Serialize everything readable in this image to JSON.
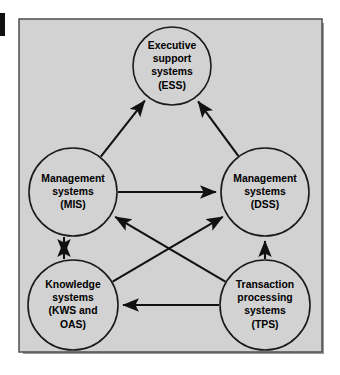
{
  "figure": {
    "background_color": "#d2d2d2",
    "border_color": "#4e4e4e",
    "line_color": "#111111",
    "text_color": "#000000"
  },
  "nodes": [
    {
      "id": "ess",
      "name": "executive-support-systems",
      "lines": [
        "Executive",
        "support",
        "systems",
        "(ESS)"
      ],
      "cx": 172,
      "cy": 66,
      "r": 39
    },
    {
      "id": "mis",
      "name": "management-information-systems",
      "lines": [
        "Management",
        "systems",
        "(MIS)"
      ],
      "cx": 73,
      "cy": 192,
      "r": 44
    },
    {
      "id": "dss",
      "name": "decision-support-systems",
      "lines": [
        "Management",
        "systems",
        "(DSS)"
      ],
      "cx": 265,
      "cy": 192,
      "r": 44
    },
    {
      "id": "kws",
      "name": "knowledge-work-and-office-automation-systems",
      "lines": [
        "Knowledge",
        "systems",
        "(KWS and",
        "OAS)"
      ],
      "cx": 73,
      "cy": 305,
      "r": 45
    },
    {
      "id": "tps",
      "name": "transaction-processing-systems",
      "lines": [
        "Transaction",
        "processing",
        "systems",
        "(TPS)"
      ],
      "cx": 265,
      "cy": 305,
      "r": 45
    }
  ],
  "edges": [
    {
      "name": "edge-mis-to-ess",
      "from": "mis",
      "to": "ess",
      "label": "MIS to ESS"
    },
    {
      "name": "edge-dss-to-ess",
      "from": "dss",
      "to": "ess",
      "label": "DSS to ESS"
    },
    {
      "name": "edge-mis-to-dss",
      "from": "mis",
      "to": "dss",
      "label": "MIS to DSS"
    },
    {
      "name": "edge-mis-to-kws",
      "from": "mis",
      "to": "kws",
      "label": "MIS to KWS"
    },
    {
      "name": "edge-kws-to-mis",
      "from": "kws",
      "to": "mis",
      "label": "KWS to MIS"
    },
    {
      "name": "edge-tps-to-dss",
      "from": "tps",
      "to": "dss",
      "label": "TPS to DSS"
    },
    {
      "name": "edge-tps-to-mis",
      "from": "tps",
      "to": "mis",
      "label": "TPS to MIS"
    },
    {
      "name": "edge-kws-to-dss",
      "from": "kws",
      "to": "dss",
      "label": "KWS to DSS"
    },
    {
      "name": "edge-tps-to-kws",
      "from": "tps",
      "to": "kws",
      "label": "TPS to KWS"
    }
  ]
}
